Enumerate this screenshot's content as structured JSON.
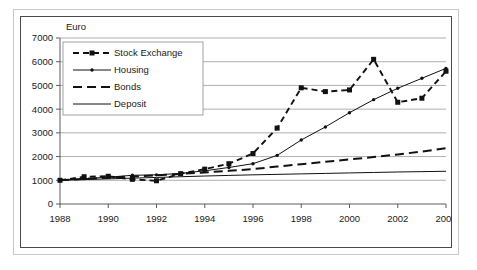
{
  "chart_data": {
    "type": "line",
    "title": "",
    "subtitle": "",
    "unit_label": "Euro",
    "xlabel": "",
    "ylabel": "",
    "ylim": [
      0,
      7000
    ],
    "ytick_step": 1000,
    "yticks": [
      "0",
      "1000",
      "2000",
      "3000",
      "4000",
      "5000",
      "6000",
      "7000"
    ],
    "xlim": [
      1988,
      2004
    ],
    "xticks": [
      "1988",
      "1990",
      "1992",
      "1994",
      "1996",
      "1998",
      "2000",
      "2002",
      "2004"
    ],
    "x": [
      1988,
      1989,
      1990,
      1991,
      1992,
      1993,
      1994,
      1995,
      1996,
      1997,
      1998,
      1999,
      2000,
      2001,
      2002,
      2003,
      2004
    ],
    "grid": true,
    "legend_position": "upper-left-inside",
    "series": [
      {
        "name": "Stock Exchange",
        "style": "dashed-square-markers",
        "color": "#111111",
        "values": [
          1000,
          1150,
          1170,
          1040,
          980,
          1280,
          1470,
          1700,
          2130,
          3200,
          4900,
          4740,
          4810,
          6100,
          4290,
          4460,
          5600
        ]
      },
      {
        "name": "Housing",
        "style": "thin-line-small-markers",
        "color": "#111111",
        "values": [
          1000,
          1070,
          1130,
          1210,
          1230,
          1290,
          1400,
          1540,
          1700,
          2050,
          2700,
          3250,
          3850,
          4400,
          4880,
          5300,
          5720
        ]
      },
      {
        "name": "Bonds",
        "style": "long-dashed",
        "color": "#111111",
        "values": [
          1000,
          1060,
          1110,
          1160,
          1210,
          1270,
          1330,
          1400,
          1470,
          1580,
          1680,
          1780,
          1880,
          1980,
          2090,
          2210,
          2350
        ]
      },
      {
        "name": "Deposit",
        "style": "solid-thin",
        "color": "#111111",
        "values": [
          1000,
          1030,
          1060,
          1090,
          1120,
          1150,
          1180,
          1205,
          1230,
          1250,
          1270,
          1290,
          1310,
          1330,
          1350,
          1365,
          1380
        ]
      }
    ]
  },
  "legend": {
    "items": [
      {
        "label": "Stock Exchange"
      },
      {
        "label": "Housing"
      },
      {
        "label": "Bonds"
      },
      {
        "label": "Deposit"
      }
    ]
  }
}
